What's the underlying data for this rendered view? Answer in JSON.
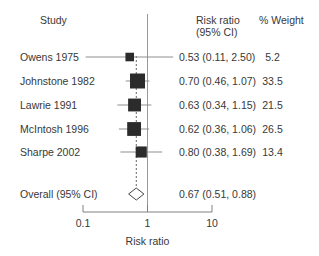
{
  "header": {
    "study": "Study",
    "risk_ratio_line1": "Risk ratio",
    "risk_ratio_line2": "(95% CI)",
    "weight": "% Weight"
  },
  "chart_data": {
    "type": "forest",
    "title": "",
    "xlabel": "Risk ratio",
    "x_scale": "log10",
    "x_range": [
      0.1,
      10
    ],
    "x_ticks": [
      0.1,
      1,
      10
    ],
    "x_tick_labels": [
      "0.1",
      "1",
      "10"
    ],
    "null_line_value": 1,
    "dashed_line_value": 0.67,
    "studies": [
      {
        "study": "Owens 1975",
        "rr": 0.53,
        "ci_low": 0.11,
        "ci_high": 2.5,
        "weight": 5.2,
        "rr_ci_label": "0.53 (0.11, 2.50)",
        "weight_label": "5.2"
      },
      {
        "study": "Johnstone 1982",
        "rr": 0.7,
        "ci_low": 0.46,
        "ci_high": 1.07,
        "weight": 33.5,
        "rr_ci_label": "0.70 (0.46, 1.07)",
        "weight_label": "33.5"
      },
      {
        "study": "Lawrie 1991",
        "rr": 0.63,
        "ci_low": 0.34,
        "ci_high": 1.15,
        "weight": 21.5,
        "rr_ci_label": "0.63 (0.34, 1.15)",
        "weight_label": "21.5"
      },
      {
        "study": "McIntosh 1996",
        "rr": 0.62,
        "ci_low": 0.36,
        "ci_high": 1.06,
        "weight": 26.5,
        "rr_ci_label": "0.62 (0.36, 1.06)",
        "weight_label": "26.5"
      },
      {
        "study": "Sharpe 2002",
        "rr": 0.8,
        "ci_low": 0.38,
        "ci_high": 1.69,
        "weight": 13.4,
        "rr_ci_label": "0.80 (0.38, 1.69)",
        "weight_label": "13.4"
      }
    ],
    "overall": {
      "label": "Overall (95% CI)",
      "rr": 0.67,
      "ci_low": 0.51,
      "ci_high": 0.88,
      "rr_ci_label": "0.67 (0.51, 0.88)"
    }
  },
  "colors": {
    "background": "#ffffff",
    "text": "#383838",
    "square": "#2b2b2b",
    "ci_line": "#8f8f8f",
    "null_line": "#999999",
    "dashed_line": "#666666",
    "axis": "#808080",
    "diamond_stroke": "#444444",
    "diamond_fill": "#ffffff"
  }
}
